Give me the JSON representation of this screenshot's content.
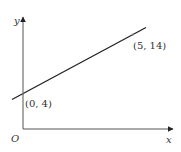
{
  "diagram": {
    "axes": {
      "x_label": "x",
      "y_label": "y",
      "origin_label": "O"
    },
    "line": {
      "points": [
        {
          "label": "(0, 4)",
          "x": 0,
          "y": 4
        },
        {
          "label": "(5, 14)",
          "x": 5,
          "y": 14
        }
      ]
    },
    "colors": {
      "axis": "#555555",
      "line": "#222222",
      "text": "#333333"
    }
  }
}
